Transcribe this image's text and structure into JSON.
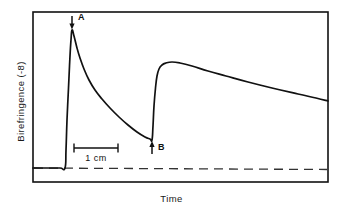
{
  "chart_data": {
    "type": "line",
    "title": "",
    "xlabel": "Time",
    "ylabel": "Birefringence (-8)",
    "grid": false,
    "legend": false,
    "axis_ticks": {
      "x": [],
      "y": []
    },
    "annotations": [
      {
        "name": "marker-a",
        "label": "A",
        "arrow": "down",
        "points_to": "first peak",
        "x": 72,
        "y": 30
      },
      {
        "name": "marker-b",
        "label": "B",
        "arrow": "up",
        "points_to": "trough",
        "x": 152,
        "y": 140
      },
      {
        "name": "scale-bar",
        "label": "1 cm",
        "x_start": 74,
        "x_end": 118,
        "y": 148
      },
      {
        "name": "baseline",
        "label": "",
        "style": "dashed",
        "y": 168
      }
    ],
    "series": [
      {
        "name": "birefringence-trace",
        "style": "solid",
        "color": "#111111",
        "points": [
          [
            33,
            168
          ],
          [
            48,
            168
          ],
          [
            60,
            168
          ],
          [
            65,
            168
          ],
          [
            66,
            150
          ],
          [
            67,
            120
          ],
          [
            68.5,
            88
          ],
          [
            70,
            56
          ],
          [
            71,
            40
          ],
          [
            72,
            30
          ],
          [
            74,
            36
          ],
          [
            77,
            48
          ],
          [
            80,
            58
          ],
          [
            84,
            69
          ],
          [
            89,
            80
          ],
          [
            95,
            90
          ],
          [
            102,
            99
          ],
          [
            110,
            108
          ],
          [
            119,
            117
          ],
          [
            128,
            125
          ],
          [
            137,
            132
          ],
          [
            145,
            137
          ],
          [
            150,
            139
          ],
          [
            152,
            140
          ],
          [
            153,
            126
          ],
          [
            154,
            106
          ],
          [
            155.5,
            88
          ],
          [
            157,
            76
          ],
          [
            159,
            69
          ],
          [
            162,
            65
          ],
          [
            166,
            63
          ],
          [
            172,
            62
          ],
          [
            180,
            63
          ],
          [
            192,
            66
          ],
          [
            208,
            71
          ],
          [
            226,
            76
          ],
          [
            248,
            82
          ],
          [
            272,
            88
          ],
          [
            298,
            94
          ],
          [
            316,
            98
          ],
          [
            328,
            101
          ]
        ]
      }
    ]
  },
  "frame": {
    "left": 33,
    "top": 12,
    "right": 328,
    "bottom": 182,
    "border_color": "#111111"
  },
  "labels": {
    "y_axis": "Birefringence (-8)",
    "x_axis": "Time",
    "marker_a": "A",
    "marker_b": "B",
    "scale_bar": "1 cm"
  }
}
